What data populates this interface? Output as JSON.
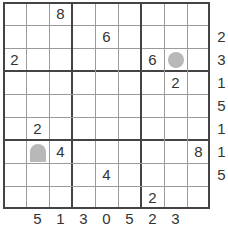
{
  "puzzle": {
    "size": 9,
    "grid": [
      [
        "",
        "",
        "8",
        "",
        "",
        "",
        "",
        "",
        ""
      ],
      [
        "",
        "",
        "",
        "",
        "6",
        "",
        "",
        "",
        ""
      ],
      [
        "2",
        "",
        "",
        "",
        "",
        "",
        "6",
        "circle",
        ""
      ],
      [
        "",
        "",
        "",
        "",
        "",
        "",
        "",
        "2",
        ""
      ],
      [
        "",
        "",
        "",
        "",
        "",
        "",
        "",
        "",
        ""
      ],
      [
        "",
        "2",
        "",
        "",
        "",
        "",
        "",
        "",
        ""
      ],
      [
        "",
        "dome",
        "4",
        "",
        "",
        "",
        "",
        "",
        "8"
      ],
      [
        "",
        "",
        "",
        "",
        "4",
        "",
        "",
        "",
        ""
      ],
      [
        "",
        "",
        "",
        "",
        "",
        "",
        "2",
        "",
        ""
      ]
    ],
    "row_clues": [
      "",
      "2",
      "3",
      "1",
      "5",
      "1",
      "1",
      "5",
      ""
    ],
    "col_clues": [
      "",
      "5",
      "1",
      "3",
      "0",
      "5",
      "2",
      "3",
      ""
    ],
    "colors": {
      "grid_thin": "#9a9a9a",
      "grid_thick": "#444444",
      "marker_gray": "#b8b8b8",
      "text": "#333333"
    }
  }
}
